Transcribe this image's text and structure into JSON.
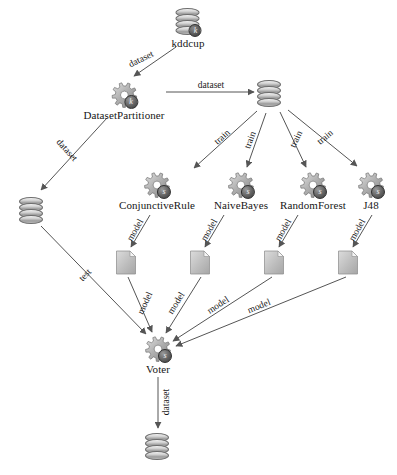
{
  "diagram": {
    "background": "#ffffff",
    "stroke": "#555555",
    "text_color": "#161616"
  },
  "nodes": [
    {
      "id": "kddcup",
      "label": "kddcup",
      "type": "database",
      "badge": "k",
      "x": 188,
      "y": 8,
      "label_below": true
    },
    {
      "id": "dataset_partitioner",
      "label": "DatasetPartitioner",
      "type": "gear",
      "badge": "k",
      "x": 124,
      "y": 82,
      "label_below": true
    },
    {
      "id": "train_db",
      "label": "",
      "type": "database",
      "badge": "",
      "x": 269,
      "y": 80,
      "label_below": false
    },
    {
      "id": "test_db",
      "label": "",
      "type": "database",
      "badge": "",
      "x": 31,
      "y": 197,
      "label_below": false
    },
    {
      "id": "conjunctive_rule",
      "label": "ConjunctiveRule",
      "type": "gear",
      "badge": "s",
      "x": 157,
      "y": 172,
      "label_below": true
    },
    {
      "id": "naive_bayes",
      "label": "NaiveBayes",
      "type": "gear",
      "badge": "s",
      "x": 241,
      "y": 172,
      "label_below": true
    },
    {
      "id": "random_forest",
      "label": "RandomForest",
      "type": "gear",
      "badge": "s",
      "x": 313,
      "y": 172,
      "label_below": true
    },
    {
      "id": "j48",
      "label": "J48",
      "type": "gear",
      "badge": "s",
      "x": 371,
      "y": 172,
      "label_below": true
    },
    {
      "id": "model_cr",
      "label": "",
      "type": "document",
      "badge": "",
      "x": 126,
      "y": 250,
      "label_below": false
    },
    {
      "id": "model_nb",
      "label": "",
      "type": "document",
      "badge": "",
      "x": 200,
      "y": 250,
      "label_below": false
    },
    {
      "id": "model_rf",
      "label": "",
      "type": "document",
      "badge": "",
      "x": 274,
      "y": 250,
      "label_below": false
    },
    {
      "id": "model_j48",
      "label": "",
      "type": "document",
      "badge": "",
      "x": 348,
      "y": 250,
      "label_below": false
    },
    {
      "id": "voter",
      "label": "Voter",
      "type": "gear",
      "badge": "s",
      "x": 158,
      "y": 336,
      "label_below": true
    },
    {
      "id": "result_db",
      "label": "",
      "type": "database",
      "badge": "",
      "x": 157,
      "y": 433,
      "label_below": false
    }
  ],
  "edges": [
    {
      "id": "e1",
      "from": "kddcup",
      "to": "dataset_partitioner",
      "label": "dataset",
      "x1": 176,
      "y1": 47,
      "x2": 134,
      "y2": 76,
      "lx": 141,
      "ly": 59,
      "rot": -26
    },
    {
      "id": "e2",
      "from": "dataset_partitioner",
      "to": "train_db",
      "label": "dataset",
      "x1": 166,
      "y1": 92,
      "x2": 254,
      "y2": 92,
      "lx": 211,
      "ly": 85,
      "rot": 0
    },
    {
      "id": "e3",
      "from": "dataset_partitioner",
      "to": "test_db",
      "label": "dataset",
      "x1": 107,
      "y1": 118,
      "x2": 41,
      "y2": 190,
      "lx": 67,
      "ly": 150,
      "rot": 48
    },
    {
      "id": "e4",
      "from": "train_db",
      "to": "conjunctive_rule",
      "label": "train",
      "x1": 257,
      "y1": 111,
      "x2": 194,
      "y2": 168,
      "lx": 222,
      "ly": 137,
      "rot": -42
    },
    {
      "id": "e5",
      "from": "train_db",
      "to": "naive_bayes",
      "label": "train",
      "x1": 266,
      "y1": 113,
      "x2": 247,
      "y2": 167,
      "lx": 250,
      "ly": 140,
      "rot": -70
    },
    {
      "id": "e6",
      "from": "train_db",
      "to": "random_forest",
      "label": "train",
      "x1": 280,
      "y1": 112,
      "x2": 306,
      "y2": 167,
      "lx": 296,
      "ly": 139,
      "rot": -64
    },
    {
      "id": "e7",
      "from": "train_db",
      "to": "j48",
      "label": "train",
      "x1": 288,
      "y1": 110,
      "x2": 357,
      "y2": 166,
      "lx": 325,
      "ly": 137,
      "rot": -40
    },
    {
      "id": "e8",
      "from": "conjunctive_rule",
      "to": "model_cr",
      "label": "model",
      "x1": 150,
      "y1": 215,
      "x2": 131,
      "y2": 247,
      "lx": 135,
      "ly": 230,
      "rot": -60
    },
    {
      "id": "e9",
      "from": "naive_bayes",
      "to": "model_nb",
      "label": "model",
      "x1": 224,
      "y1": 215,
      "x2": 205,
      "y2": 247,
      "lx": 209,
      "ly": 230,
      "rot": -60
    },
    {
      "id": "e10",
      "from": "random_forest",
      "to": "model_rf",
      "label": "model",
      "x1": 298,
      "y1": 215,
      "x2": 279,
      "y2": 247,
      "lx": 283,
      "ly": 230,
      "rot": -60
    },
    {
      "id": "e11",
      "from": "j48",
      "to": "model_j48",
      "label": "model",
      "x1": 372,
      "y1": 215,
      "x2": 353,
      "y2": 247,
      "lx": 357,
      "ly": 230,
      "rot": -60
    },
    {
      "id": "e12",
      "from": "test_db",
      "to": "voter",
      "label": "test",
      "x1": 41,
      "y1": 226,
      "x2": 146,
      "y2": 334,
      "lx": 85,
      "ly": 275,
      "rot": -47
    },
    {
      "id": "e13",
      "from": "model_cr",
      "to": "voter",
      "label": "model",
      "x1": 128,
      "y1": 277,
      "x2": 152,
      "y2": 332,
      "lx": 145,
      "ly": 303,
      "rot": -65
    },
    {
      "id": "e14",
      "from": "model_nb",
      "to": "voter",
      "label": "model",
      "x1": 201,
      "y1": 277,
      "x2": 166,
      "y2": 333,
      "lx": 176,
      "ly": 303,
      "rot": -58
    },
    {
      "id": "e15",
      "from": "model_rf",
      "to": "voter",
      "label": "model",
      "x1": 272,
      "y1": 277,
      "x2": 173,
      "y2": 341,
      "lx": 218,
      "ly": 305,
      "rot": -33
    },
    {
      "id": "e16",
      "from": "model_j48",
      "to": "voter",
      "label": "model",
      "x1": 346,
      "y1": 277,
      "x2": 176,
      "y2": 346,
      "lx": 259,
      "ly": 306,
      "rot": -22
    },
    {
      "id": "e17",
      "from": "voter",
      "to": "result_db",
      "label": "dataset",
      "x1": 158,
      "y1": 377,
      "x2": 158,
      "y2": 428,
      "lx": 166,
      "ly": 402,
      "rot": -90
    }
  ]
}
